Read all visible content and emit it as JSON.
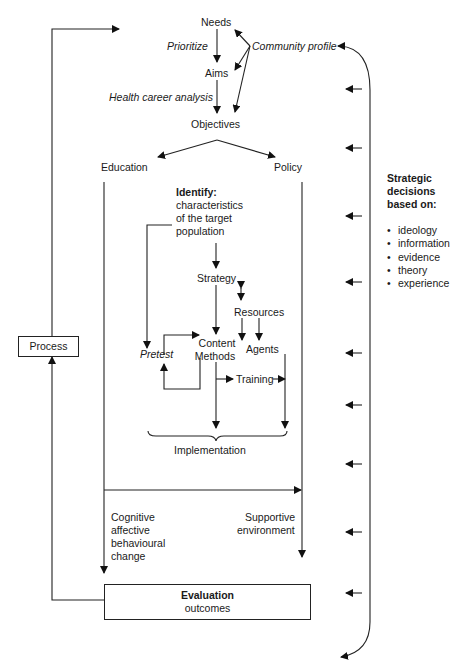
{
  "nodes": {
    "needs": "Needs",
    "prioritize": "Prioritize",
    "community_profile": "Community profile",
    "aims": "Aims",
    "health_career_analysis": "Health career analysis",
    "objectives": "Objectives",
    "education": "Education",
    "policy": "Policy",
    "identify_title": "Identify:",
    "identify_lines": [
      "characteristics",
      "of the target",
      "population"
    ],
    "strategy": "Strategy",
    "resources": "Resources",
    "content": "Content",
    "methods": "Methods",
    "agents": "Agents",
    "pretest": "Pretest",
    "training": "Training",
    "implementation": "Implementation",
    "process": "Process",
    "cognitive_lines": [
      "Cognitive",
      "affective",
      "behavioural",
      "change"
    ],
    "supportive_lines": [
      "Supportive",
      "environment"
    ],
    "evaluation_title": "Evaluation",
    "evaluation_sub": "outcomes"
  },
  "strategic": {
    "title_lines": [
      "Strategic",
      "decisions",
      "based on:"
    ],
    "items": [
      "ideology",
      "information",
      "evidence",
      "theory",
      "experience"
    ]
  }
}
